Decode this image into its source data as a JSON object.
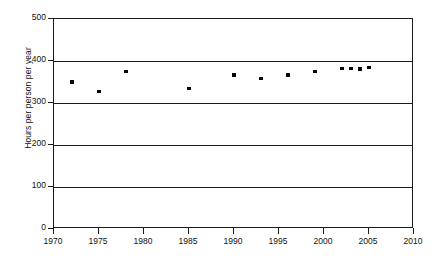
{
  "chart_data": {
    "type": "scatter",
    "title": "",
    "xlabel": "",
    "ylabel": "Hours per person per year",
    "xlim": [
      1970,
      2010
    ],
    "ylim": [
      0,
      500
    ],
    "grid": true,
    "grid_axis": "y",
    "legend": "none",
    "xticks": [
      1970,
      1975,
      1980,
      1985,
      1990,
      1995,
      2000,
      2005,
      2010
    ],
    "xtick_labels": [
      "1970",
      "1975",
      "1980",
      "1985",
      "1990",
      "1995",
      "2000",
      "2005",
      "2010"
    ],
    "yticks": [
      0,
      100,
      200,
      300,
      400,
      500
    ],
    "ytick_labels": [
      "0",
      "100",
      "200",
      "300",
      "400",
      "500"
    ],
    "series": [
      {
        "name": "Hours per person per year",
        "marker": "square",
        "color": "#000000",
        "points": [
          {
            "x": 1972,
            "y": 350
          },
          {
            "x": 1975,
            "y": 327
          },
          {
            "x": 1978,
            "y": 375
          },
          {
            "x": 1985,
            "y": 335
          },
          {
            "x": 1990,
            "y": 367
          },
          {
            "x": 1993,
            "y": 359
          },
          {
            "x": 1996,
            "y": 367
          },
          {
            "x": 1999,
            "y": 375
          },
          {
            "x": 2002,
            "y": 382
          },
          {
            "x": 2003,
            "y": 382
          },
          {
            "x": 2004,
            "y": 381
          },
          {
            "x": 2005,
            "y": 385
          }
        ]
      }
    ]
  }
}
